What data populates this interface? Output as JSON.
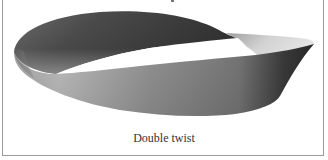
{
  "figure": {
    "caption": "Double twist",
    "colors": {
      "background": "#ffffff",
      "border": "#9a9a9a",
      "surface_dark": "#3a3a3a",
      "surface_mid": "#8a8a8a",
      "surface_light": "#d8d8d8",
      "caption_text": "#333333"
    }
  }
}
